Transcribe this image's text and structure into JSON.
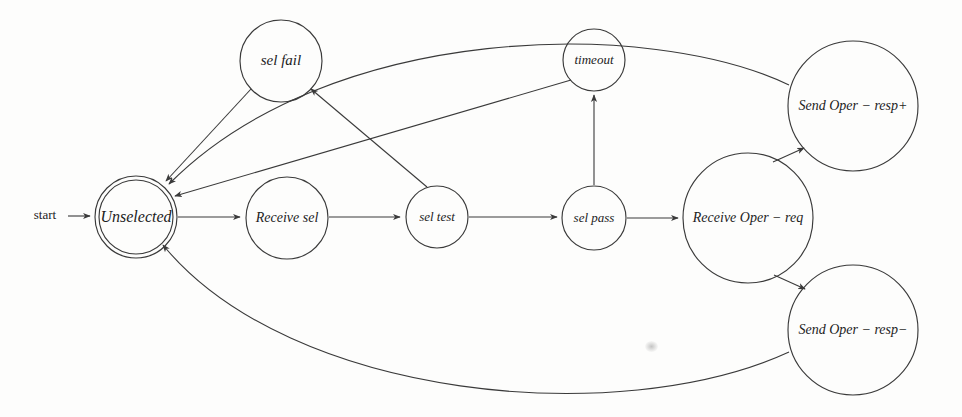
{
  "diagram": {
    "type": "state-transition-diagram",
    "background_color": "#fdfdfc",
    "stroke_color": "#3a3a3a",
    "start_label": "start",
    "nodes": [
      {
        "id": "unselected",
        "label": "Unselected",
        "cx": 136,
        "cy": 217,
        "r": 41,
        "double": true,
        "font_size": 16
      },
      {
        "id": "sel_fail",
        "label": "sel fail",
        "cx": 281,
        "cy": 61,
        "r": 41,
        "double": false,
        "font_size": 15
      },
      {
        "id": "receive_sel",
        "label": "Receive sel",
        "cx": 287,
        "cy": 218,
        "r": 41,
        "double": false,
        "font_size": 14
      },
      {
        "id": "sel_test",
        "label": "sel test",
        "cx": 437,
        "cy": 217,
        "r": 31,
        "double": false,
        "font_size": 13
      },
      {
        "id": "timeout",
        "label": "timeout",
        "cx": 594,
        "cy": 60,
        "r": 31,
        "double": false,
        "font_size": 13
      },
      {
        "id": "sel_pass",
        "label": "sel pass",
        "cx": 594,
        "cy": 218,
        "r": 32,
        "double": false,
        "font_size": 13
      },
      {
        "id": "receive_oper_req",
        "label": "Receive Oper − req",
        "cx": 748,
        "cy": 218,
        "r": 65,
        "double": false,
        "font_size": 14
      },
      {
        "id": "send_oper_resp_p",
        "label": "Send Oper − resp+",
        "cx": 853,
        "cy": 106,
        "r": 65,
        "double": false,
        "font_size": 14
      },
      {
        "id": "send_oper_resp_m",
        "label": "Send Oper − resp−",
        "cx": 853,
        "cy": 330,
        "r": 65,
        "double": false,
        "font_size": 14
      }
    ],
    "edges": [
      {
        "id": "start-to-unselected",
        "from": "start",
        "to": "unselected",
        "path": "M 68 216 L 90 216"
      },
      {
        "id": "unselected-to-receive-sel",
        "from": "unselected",
        "to": "receive_sel",
        "path": "M 178 217 L 240 217"
      },
      {
        "id": "receive-sel-to-sel-test",
        "from": "receive_sel",
        "to": "sel_test",
        "path": "M 329 217 L 400 217"
      },
      {
        "id": "sel-test-to-sel-pass",
        "from": "sel_test",
        "to": "sel_pass",
        "path": "M 469 217 L 557 217"
      },
      {
        "id": "sel-pass-to-receive-oper",
        "from": "sel_pass",
        "to": "receive_oper_req",
        "path": "M 627 218 L 678 218"
      },
      {
        "id": "sel-test-to-sel-fail",
        "from": "sel_test",
        "to": "sel_fail",
        "path": "M 427 187 L 311 89"
      },
      {
        "id": "sel-pass-to-timeout",
        "from": "sel_pass",
        "to": "timeout",
        "path": "M 594 185 L 594 95"
      },
      {
        "id": "sel-fail-to-unselected",
        "from": "sel_fail",
        "to": "unselected",
        "path": "M 251 89 L 166 181"
      },
      {
        "id": "timeout-to-unselected",
        "from": "timeout",
        "to": "unselected",
        "path": "M 571 80 L 175 196"
      },
      {
        "id": "resp-plus-to-unselected",
        "from": "send_oper_resp_p",
        "to": "unselected",
        "path": "M 789 85 C 650 18 330 22 169 184"
      },
      {
        "id": "receive-oper-to-resp-plus",
        "from": "receive_oper_req",
        "to": "send_oper_resp_p",
        "path": "M 773 162 L 804 148"
      },
      {
        "id": "receive-oper-to-resp-minus",
        "from": "receive_oper_req",
        "to": "send_oper_resp_m",
        "path": "M 774 275 L 805 289"
      },
      {
        "id": "resp-minus-to-unselected",
        "from": "send_oper_resp_m",
        "to": "unselected",
        "path": "M 789 352 C 620 430 290 400 163 245"
      }
    ],
    "artifacts": [
      {
        "id": "paper-smudge",
        "x": 645,
        "y": 341
      }
    ]
  }
}
